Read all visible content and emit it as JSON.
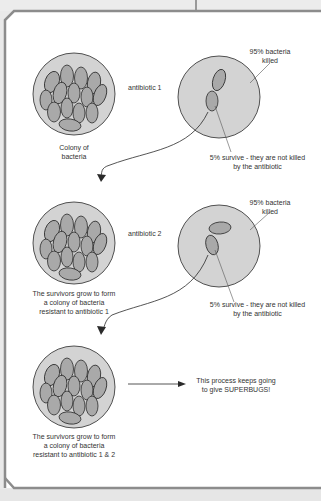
{
  "diagram": {
    "stages": [
      {
        "id": "colony",
        "caption_lines": [
          "Colony of",
          "bacteria"
        ]
      },
      {
        "id": "treated-1",
        "antibiotic": "antibiotic 1",
        "killed": [
          "95% bacteria",
          "killed"
        ],
        "survive": [
          "5% survive - they are not killed",
          "by the antibiotic"
        ]
      },
      {
        "id": "resistant-1",
        "caption_lines": [
          "The survivors grow to form",
          "a colony of bacteria",
          "resistant to antibiotic 1"
        ]
      },
      {
        "id": "treated-2",
        "antibiotic": "antibiotic 2",
        "killed": [
          "95% bacteria",
          "killed"
        ],
        "survive": [
          "5% survive - they are not killed",
          "by the antibiotic"
        ]
      },
      {
        "id": "resistant-2",
        "caption_lines": [
          "The survivors grow to form",
          "a colony of bacteria",
          "resistant to antibiotic 1 & 2"
        ]
      }
    ],
    "conclusion": [
      "This process keeps going",
      "to give SUPERBUGS!"
    ],
    "colors": {
      "dish_fill": "#d3d3d3",
      "bacteria_fill": "#a9a9a9",
      "outline": "#2a2a2a",
      "frame": "#8c8c8c",
      "background": "#ffffff"
    }
  }
}
